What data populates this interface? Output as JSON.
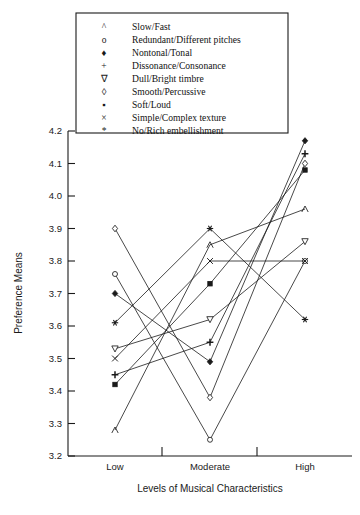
{
  "chart_data": {
    "type": "line",
    "title": "",
    "xlabel": "Levels of Musical Characteristics",
    "ylabel": "Preference Means",
    "categories": [
      "Low",
      "Moderate",
      "High"
    ],
    "ylim": [
      3.2,
      4.2
    ],
    "ytick_labels": [
      "3.2",
      "3.3",
      "3.4",
      "3.5",
      "3.6",
      "3.7",
      "3.8",
      "3.9",
      "4.0",
      "4.1",
      "4.2"
    ],
    "ytick_values": [
      3.2,
      3.3,
      3.4,
      3.5,
      3.6,
      3.7,
      3.8,
      3.9,
      4.0,
      4.1,
      4.2
    ],
    "grid": false,
    "legend_position": "top-center",
    "series": [
      {
        "name": "Slow/Fast",
        "marker": "caret",
        "values": [
          3.28,
          3.85,
          3.96
        ]
      },
      {
        "name": "Redundant/Different pitches",
        "marker": "circle-open",
        "values": [
          3.76,
          3.25,
          3.8
        ]
      },
      {
        "name": "Nontonal/Tonal",
        "marker": "diamond-fill",
        "values": [
          3.7,
          3.49,
          4.17
        ]
      },
      {
        "name": "Dissonance/Consonance",
        "marker": "plus",
        "values": [
          3.45,
          3.55,
          4.13
        ]
      },
      {
        "name": "Dull/Bright timbre",
        "marker": "triangle-down",
        "values": [
          3.53,
          3.62,
          3.86
        ]
      },
      {
        "name": "Smooth/Percussive",
        "marker": "diamond-open",
        "values": [
          3.9,
          3.38,
          4.1
        ]
      },
      {
        "name": "Soft/Loud",
        "marker": "square-fill",
        "values": [
          3.42,
          3.73,
          4.08
        ]
      },
      {
        "name": "Simple/Complex texture",
        "marker": "times",
        "values": [
          3.5,
          3.8,
          3.8
        ]
      },
      {
        "name": "No/Rich embellishment",
        "marker": "asterisk",
        "values": [
          3.61,
          3.9,
          3.62
        ]
      }
    ]
  },
  "legend": {
    "items": [
      {
        "glyph": "^",
        "label": "Slow/Fast"
      },
      {
        "glyph": "o",
        "label": "Redundant/Different pitches"
      },
      {
        "glyph": "♦",
        "label": "Nontonal/Tonal"
      },
      {
        "glyph": "+",
        "label": "Dissonance/Consonance"
      },
      {
        "glyph": "∇",
        "label": "Dull/Bright timbre"
      },
      {
        "glyph": "◊",
        "label": "Smooth/Percussive"
      },
      {
        "glyph": "▪",
        "label": "Soft/Loud"
      },
      {
        "glyph": "×",
        "label": "Simple/Complex texture"
      },
      {
        "glyph": "*",
        "label": "No/Rich embellishment"
      }
    ]
  },
  "colors": {
    "ink": "#1a1a1a",
    "background": "#ffffff"
  }
}
